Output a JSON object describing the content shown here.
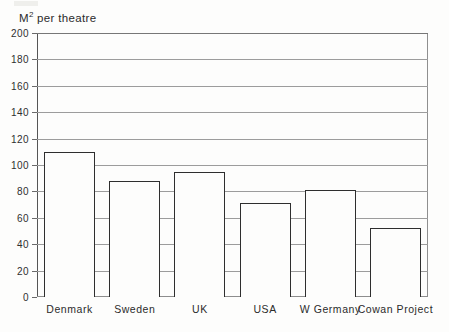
{
  "chart_data": {
    "type": "bar",
    "title": "M2 per theatre",
    "title_prefix": "M",
    "title_superscript": "2",
    "title_suffix": "per theatre",
    "xlabel": "",
    "ylabel": "",
    "categories": [
      "Denmark",
      "Sweden",
      "UK",
      "USA",
      "W Germany",
      "Cowan Project"
    ],
    "values": [
      110,
      88,
      95,
      71,
      81,
      52
    ],
    "ylim": [
      0,
      200
    ],
    "ytick_step": 20,
    "yticks": [
      0,
      20,
      40,
      60,
      80,
      100,
      120,
      140,
      160,
      180,
      200
    ],
    "grid": true,
    "grid_axis": "y",
    "legend": "none",
    "bar_fill": "#fdfdfc",
    "bar_outline": "#2e2e2e",
    "grid_color": "#9c9c9c",
    "axis_color": "#555555",
    "background": "#fdfdfc"
  }
}
